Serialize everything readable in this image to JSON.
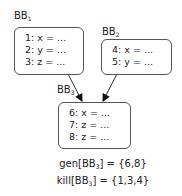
{
  "blocks": [
    {
      "name": "BB",
      "sub": "1",
      "lines": [
        "1: x = ...",
        "2: y = ...",
        "3: z = ..."
      ]
    },
    {
      "name": "BB",
      "sub": "2",
      "lines": [
        "4: x = ...",
        "5: y = ..."
      ]
    },
    {
      "name": "BB",
      "sub": "3",
      "lines": [
        "6: x = ...",
        "7: z = ...",
        "8: z = ..."
      ]
    }
  ],
  "sets": {
    "gen": {
      "prefix": "gen[BB",
      "sub": "3",
      "suffix": "] = {6,8}"
    },
    "kill": {
      "prefix": "kill[BB",
      "sub": "3",
      "suffix": "] = {1,3,4}"
    }
  },
  "edges": [
    {
      "from": "BB1",
      "to": "BB3"
    },
    {
      "from": "BB2",
      "to": "BB3"
    }
  ]
}
